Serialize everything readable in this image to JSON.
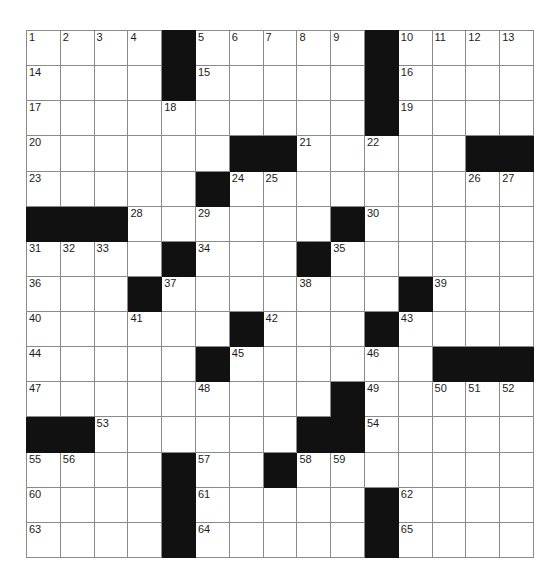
{
  "puzzle": {
    "type": "crossword-grid",
    "rows": 15,
    "cols": 15,
    "cell_width_px": 32.8,
    "cell_height_px": 34.13,
    "grid_origin_px": [
      26,
      30
    ],
    "colors": {
      "block": "#111111",
      "cell": "#ffffff",
      "grid_line": "#8a8a8a",
      "number_text": "#1b1b1b",
      "page_background": "#ffffff"
    },
    "blocks": [
      [
        0,
        4
      ],
      [
        0,
        10
      ],
      [
        1,
        4
      ],
      [
        1,
        10
      ],
      [
        2,
        10
      ],
      [
        3,
        6
      ],
      [
        3,
        7
      ],
      [
        3,
        13
      ],
      [
        3,
        14
      ],
      [
        4,
        5
      ],
      [
        5,
        0
      ],
      [
        5,
        1
      ],
      [
        5,
        2
      ],
      [
        5,
        9
      ],
      [
        6,
        4
      ],
      [
        6,
        8
      ],
      [
        7,
        3
      ],
      [
        7,
        11
      ],
      [
        8,
        6
      ],
      [
        8,
        10
      ],
      [
        9,
        5
      ],
      [
        9,
        12
      ],
      [
        9,
        13
      ],
      [
        9,
        14
      ],
      [
        10,
        9
      ],
      [
        11,
        0
      ],
      [
        11,
        1
      ],
      [
        11,
        8
      ],
      [
        11,
        9
      ],
      [
        12,
        4
      ],
      [
        12,
        7
      ],
      [
        13,
        4
      ],
      [
        13,
        10
      ],
      [
        14,
        4
      ],
      [
        14,
        10
      ]
    ],
    "numbers": [
      {
        "row": 0,
        "col": 0,
        "n": 1
      },
      {
        "row": 0,
        "col": 1,
        "n": 2
      },
      {
        "row": 0,
        "col": 2,
        "n": 3
      },
      {
        "row": 0,
        "col": 3,
        "n": 4
      },
      {
        "row": 0,
        "col": 5,
        "n": 5
      },
      {
        "row": 0,
        "col": 6,
        "n": 6
      },
      {
        "row": 0,
        "col": 7,
        "n": 7
      },
      {
        "row": 0,
        "col": 8,
        "n": 8
      },
      {
        "row": 0,
        "col": 9,
        "n": 9
      },
      {
        "row": 0,
        "col": 11,
        "n": 10
      },
      {
        "row": 0,
        "col": 12,
        "n": 11
      },
      {
        "row": 0,
        "col": 13,
        "n": 12
      },
      {
        "row": 0,
        "col": 14,
        "n": 13
      },
      {
        "row": 1,
        "col": 0,
        "n": 14
      },
      {
        "row": 1,
        "col": 5,
        "n": 15
      },
      {
        "row": 1,
        "col": 11,
        "n": 16
      },
      {
        "row": 2,
        "col": 0,
        "n": 17
      },
      {
        "row": 2,
        "col": 4,
        "n": 18
      },
      {
        "row": 2,
        "col": 11,
        "n": 19
      },
      {
        "row": 3,
        "col": 0,
        "n": 20
      },
      {
        "row": 3,
        "col": 8,
        "n": 21
      },
      {
        "row": 3,
        "col": 10,
        "n": 22
      },
      {
        "row": 4,
        "col": 0,
        "n": 23
      },
      {
        "row": 4,
        "col": 6,
        "n": 24
      },
      {
        "row": 4,
        "col": 7,
        "n": 25
      },
      {
        "row": 4,
        "col": 13,
        "n": 26
      },
      {
        "row": 4,
        "col": 14,
        "n": 27
      },
      {
        "row": 5,
        "col": 3,
        "n": 28
      },
      {
        "row": 5,
        "col": 5,
        "n": 29
      },
      {
        "row": 5,
        "col": 10,
        "n": 30
      },
      {
        "row": 6,
        "col": 0,
        "n": 31
      },
      {
        "row": 6,
        "col": 1,
        "n": 32
      },
      {
        "row": 6,
        "col": 2,
        "n": 33
      },
      {
        "row": 6,
        "col": 5,
        "n": 34
      },
      {
        "row": 6,
        "col": 9,
        "n": 35
      },
      {
        "row": 7,
        "col": 0,
        "n": 36
      },
      {
        "row": 7,
        "col": 4,
        "n": 37
      },
      {
        "row": 7,
        "col": 8,
        "n": 38
      },
      {
        "row": 7,
        "col": 12,
        "n": 39
      },
      {
        "row": 8,
        "col": 0,
        "n": 40
      },
      {
        "row": 8,
        "col": 3,
        "n": 41
      },
      {
        "row": 8,
        "col": 7,
        "n": 42
      },
      {
        "row": 8,
        "col": 11,
        "n": 43
      },
      {
        "row": 9,
        "col": 0,
        "n": 44
      },
      {
        "row": 9,
        "col": 6,
        "n": 45
      },
      {
        "row": 9,
        "col": 10,
        "n": 46
      },
      {
        "row": 10,
        "col": 0,
        "n": 47
      },
      {
        "row": 10,
        "col": 5,
        "n": 48
      },
      {
        "row": 10,
        "col": 10,
        "n": 49
      },
      {
        "row": 10,
        "col": 12,
        "n": 50
      },
      {
        "row": 10,
        "col": 13,
        "n": 51
      },
      {
        "row": 10,
        "col": 14,
        "n": 52
      },
      {
        "row": 11,
        "col": 2,
        "n": 53
      },
      {
        "row": 11,
        "col": 10,
        "n": 54
      },
      {
        "row": 12,
        "col": 0,
        "n": 55
      },
      {
        "row": 12,
        "col": 1,
        "n": 56
      },
      {
        "row": 12,
        "col": 5,
        "n": 57
      },
      {
        "row": 12,
        "col": 8,
        "n": 58
      },
      {
        "row": 12,
        "col": 9,
        "n": 59
      },
      {
        "row": 13,
        "col": 0,
        "n": 60
      },
      {
        "row": 13,
        "col": 5,
        "n": 61
      },
      {
        "row": 13,
        "col": 11,
        "n": 62
      },
      {
        "row": 14,
        "col": 0,
        "n": 63
      },
      {
        "row": 14,
        "col": 5,
        "n": 64
      },
      {
        "row": 14,
        "col": 11,
        "n": 65
      }
    ],
    "letters": []
  }
}
